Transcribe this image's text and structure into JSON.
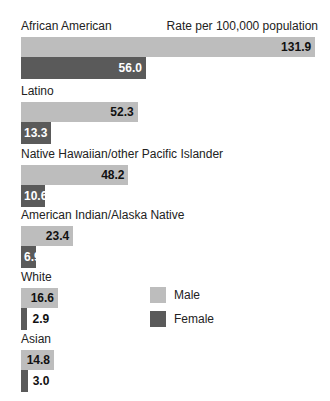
{
  "chart_data": {
    "type": "bar",
    "orientation": "horizontal",
    "title": "",
    "unit_label": "Rate per 100,000 population",
    "xlabel": "Rate per 100,000 population",
    "ylabel": "",
    "categories": [
      "African American",
      "Latino",
      "Native Hawaiian/other Pacific Islander",
      "American Indian/Alaska Native",
      "White",
      "Asian"
    ],
    "series": [
      {
        "name": "Male",
        "color": "#bdbdbd",
        "values": [
          131.9,
          52.3,
          48.2,
          23.4,
          16.6,
          14.8
        ]
      },
      {
        "name": "Female",
        "color": "#5a5a5a",
        "values": [
          56.0,
          13.3,
          10.6,
          6.9,
          2.9,
          3.0
        ]
      }
    ],
    "value_labels": {
      "male": [
        "131.9",
        "52.3",
        "48.2",
        "23.4",
        "16.6",
        "14.8"
      ],
      "female": [
        "56.0",
        "13.3",
        "10.6",
        "6.9",
        "2.9",
        "3.0"
      ]
    },
    "legend": {
      "position": "lower-right",
      "entries": [
        "Male",
        "Female"
      ]
    },
    "grid": false,
    "xlim": [
      0,
      132
    ]
  },
  "colors": {
    "male": "#bdbdbd",
    "female": "#5a5a5a",
    "female_label_inside": "#ffffff",
    "label_outside": "#111111"
  }
}
